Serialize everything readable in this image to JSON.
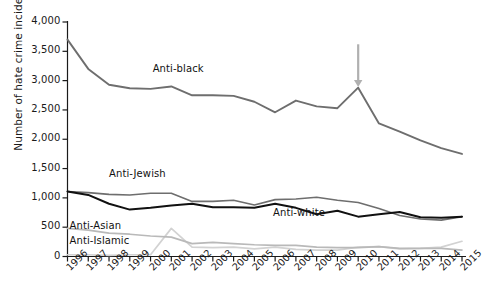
{
  "chart_data": {
    "type": "line",
    "title": "",
    "xlabel": "",
    "ylabel": "Number of hate crime incidents",
    "xlim": [
      1996,
      2015
    ],
    "ylim": [
      0,
      4000
    ],
    "grid": false,
    "legend_position": "inline-labels",
    "x": [
      1996,
      1997,
      1998,
      1999,
      2000,
      2001,
      2002,
      2003,
      2004,
      2005,
      2006,
      2007,
      2008,
      2009,
      2010,
      2011,
      2012,
      2013,
      2014,
      2015
    ],
    "xtick_labels": [
      "1996",
      "1997",
      "1998",
      "1999",
      "2000",
      "2001",
      "2002",
      "2003",
      "2004",
      "2005",
      "2006",
      "2007",
      "2008",
      "2009",
      "2010",
      "2011",
      "2012",
      "2013",
      "2014",
      "2015"
    ],
    "ytick_labels": [
      "0",
      "500",
      "1,000",
      "1,500",
      "2,000",
      "2,500",
      "3,000",
      "3,500",
      "4,000"
    ],
    "ytick_values": [
      0,
      500,
      1000,
      1500,
      2000,
      2500,
      3000,
      3500,
      4000
    ],
    "series": [
      {
        "name": "Anti-black",
        "color": "#6e6e6e",
        "width": 1.9,
        "label_x": 2000.1,
        "label_y": 3180,
        "values": [
          3700,
          3200,
          2930,
          2870,
          2860,
          2900,
          2750,
          2750,
          2740,
          2640,
          2460,
          2660,
          2560,
          2530,
          2880,
          2270,
          2130,
          1980,
          1850,
          1750
        ]
      },
      {
        "name": "Anti-Jewish",
        "color": "#6e6e6e",
        "width": 1.6,
        "label_x": 1998.0,
        "label_y": 1390,
        "values": [
          1110,
          1090,
          1060,
          1050,
          1080,
          1080,
          940,
          940,
          960,
          880,
          970,
          980,
          1010,
          960,
          920,
          820,
          700,
          640,
          620,
          680
        ]
      },
      {
        "name": "Anti-white",
        "color": "#111111",
        "width": 2.0,
        "label_x": 2005.9,
        "label_y": 730,
        "values": [
          1110,
          1050,
          900,
          800,
          830,
          870,
          900,
          840,
          840,
          830,
          900,
          830,
          720,
          780,
          680,
          720,
          760,
          670,
          660,
          680
        ]
      },
      {
        "name": "Anti-Asian",
        "color": "#b9b9b9",
        "width": 1.7,
        "label_x": 1996.1,
        "label_y": 510,
        "values": [
          480,
          450,
          400,
          380,
          350,
          330,
          220,
          240,
          220,
          200,
          190,
          190,
          160,
          150,
          150,
          170,
          140,
          140,
          140,
          110
        ]
      },
      {
        "name": "Anti-Islamic",
        "color": "#d2d2d2",
        "width": 1.7,
        "label_x": 1996.1,
        "label_y": 250,
        "values": [
          30,
          30,
          20,
          30,
          30,
          480,
          160,
          150,
          160,
          130,
          160,
          120,
          110,
          110,
          160,
          170,
          130,
          140,
          160,
          260
        ]
      }
    ],
    "annotations": [
      {
        "type": "arrow-down",
        "name": "peak-arrow",
        "x": 2010,
        "y_top": 2890,
        "y_bottom": 3620,
        "color": "#b0b0b0"
      }
    ]
  }
}
